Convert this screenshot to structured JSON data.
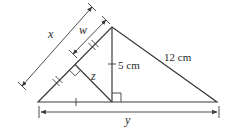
{
  "diagram": {
    "type": "geometry-triangle",
    "colors": {
      "stroke": "#3a3a3a",
      "text": "#2a2a2a",
      "background": "#ffffff"
    },
    "labels": {
      "x": "x",
      "w": "w",
      "z": "z",
      "y": "y",
      "altitude": "5 cm",
      "hypotenuse": "12 cm"
    },
    "vertices": {
      "left": [
        38,
        102
      ],
      "top": [
        112,
        27
      ],
      "right": [
        217,
        102
      ],
      "altitude_foot": [
        112,
        102
      ],
      "perp_foot": [
        75,
        64.5
      ]
    },
    "markers": {
      "right_angles": [
        "at altitude foot",
        "at perpendicular foot on left side"
      ],
      "double_ticks": [
        "left side lower half",
        "left side upper half"
      ],
      "single_ticks": [
        "base left segment",
        "altitude"
      ]
    }
  }
}
